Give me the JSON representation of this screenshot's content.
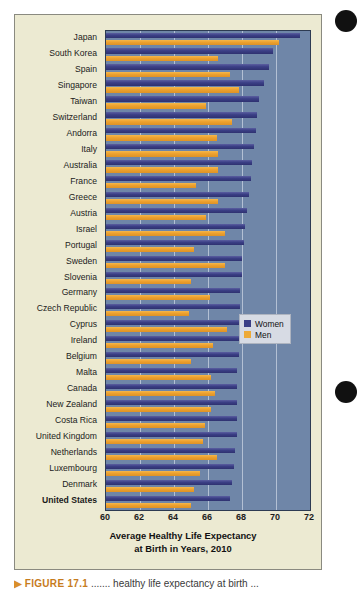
{
  "figure": {
    "panel_background": "#ecead2",
    "plot_background": "#6f86a8",
    "caption_marker": "▶",
    "caption_number": "FIGURE 17.1",
    "caption_text": "  ....... healthy life expectancy at birth ..."
  },
  "legend": {
    "position": "inside-right-middle",
    "entries": [
      {
        "label": "Women",
        "color": "#3b3f86"
      },
      {
        "label": "Men",
        "color": "#edaa38"
      }
    ]
  },
  "axis": {
    "title_line1": "Average Healthy Life Expectancy",
    "title_line2": "at Birth in Years, 2010",
    "ticks": [
      "60",
      "62",
      "64",
      "66",
      "68",
      "70",
      "72"
    ]
  },
  "chart_data": {
    "type": "bar",
    "orientation": "horizontal",
    "title": "Average Healthy Life Expectancy at Birth in Years, 2010",
    "xlabel": "Average Healthy Life Expectancy at Birth in Years, 2010",
    "ylabel": "",
    "xlim": [
      60,
      72
    ],
    "xticks": [
      60,
      62,
      64,
      66,
      68,
      70,
      72
    ],
    "grid": true,
    "legend_position": "inside right middle",
    "categories": [
      "Japan",
      "South Korea",
      "Spain",
      "Singapore",
      "Taiwan",
      "Switzerland",
      "Andorra",
      "Italy",
      "Australia",
      "France",
      "Greece",
      "Austria",
      "Israel",
      "Portugal",
      "Sweden",
      "Slovenia",
      "Germany",
      "Czech Republic",
      "Cyprus",
      "Ireland",
      "Belgium",
      "Malta",
      "Canada",
      "New Zealand",
      "Costa Rica",
      "United Kingdom",
      "Netherlands",
      "Luxembourg",
      "Denmark",
      "United States"
    ],
    "series": [
      {
        "name": "Women",
        "color": "#3b3f86",
        "values": [
          71.4,
          69.8,
          69.6,
          69.3,
          69.0,
          68.9,
          68.8,
          68.7,
          68.6,
          68.5,
          68.4,
          68.3,
          68.2,
          68.1,
          68.0,
          68.0,
          67.9,
          67.9,
          67.8,
          67.8,
          67.8,
          67.7,
          67.7,
          67.7,
          67.7,
          67.7,
          67.6,
          67.5,
          67.4,
          67.3
        ]
      },
      {
        "name": "Men",
        "color": "#edaa38",
        "values": [
          70.2,
          66.6,
          67.3,
          67.8,
          65.9,
          67.4,
          66.5,
          66.6,
          66.6,
          65.3,
          66.6,
          65.9,
          67.0,
          65.2,
          67.0,
          65.0,
          66.1,
          64.9,
          67.1,
          66.3,
          65.0,
          66.2,
          66.4,
          66.2,
          65.8,
          65.7,
          66.5,
          65.5,
          65.2,
          65.0
        ]
      }
    ]
  }
}
